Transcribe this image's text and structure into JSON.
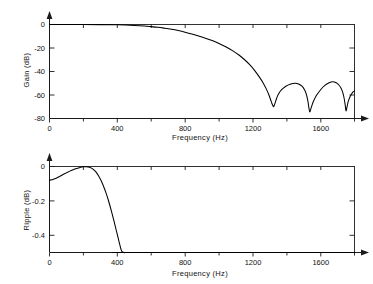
{
  "figure": {
    "background": "#ffffff",
    "line_color": "#000000",
    "axis_color": "#1a1a1a"
  },
  "chart_data": [
    {
      "type": "line",
      "id": "gain-response",
      "title": "",
      "xlabel": "Frequency (Hz)",
      "ylabel": "Gain (dB)",
      "xlim": [
        0,
        1800
      ],
      "ylim": [
        -80,
        0
      ],
      "xticks": [
        0,
        400,
        800,
        1200,
        1600
      ],
      "xticklabels": [
        "0",
        "400",
        "800",
        "1200",
        "1600"
      ],
      "xminorticks": [
        200,
        600,
        1000,
        1400,
        1800
      ],
      "yticks": [
        0,
        -20,
        -40,
        -60,
        -80
      ],
      "yticklabels": [
        "0",
        "-20",
        "-40",
        "-60",
        "-80"
      ],
      "grid": false,
      "legend": "none",
      "series": [
        {
          "name": "gain",
          "x": [
            0,
            100,
            200,
            300,
            400,
            500,
            560,
            600,
            640,
            680,
            720,
            760,
            800,
            840,
            880,
            920,
            960,
            1000,
            1040,
            1080,
            1120,
            1150,
            1180,
            1210,
            1240,
            1260,
            1280,
            1295,
            1305,
            1312,
            1318,
            1322,
            1326,
            1332,
            1340,
            1352,
            1370,
            1395,
            1420,
            1450,
            1470,
            1490,
            1505,
            1515,
            1522,
            1527,
            1531,
            1536,
            1544,
            1556,
            1575,
            1600,
            1625,
            1650,
            1672,
            1692,
            1708,
            1720,
            1730,
            1737,
            1742,
            1746,
            1750,
            1756,
            1764,
            1775,
            1788,
            1800
          ],
          "y": [
            -0.05,
            -0.06,
            -0.05,
            -0.1,
            -0.3,
            -0.8,
            -1.3,
            -1.8,
            -2.4,
            -3.2,
            -4.1,
            -5.2,
            -6.5,
            -8.0,
            -9.7,
            -11.6,
            -13.7,
            -16.1,
            -18.9,
            -22.2,
            -26.2,
            -29.8,
            -34.0,
            -39.0,
            -45.0,
            -49.5,
            -55.0,
            -60.0,
            -64.0,
            -67.0,
            -69.0,
            -70.0,
            -69.0,
            -66.5,
            -63.0,
            -59.0,
            -55.5,
            -52.5,
            -50.8,
            -50.0,
            -50.6,
            -52.5,
            -55.5,
            -59.0,
            -63.0,
            -67.0,
            -71.0,
            -74.5,
            -71.0,
            -66.0,
            -60.5,
            -55.5,
            -51.8,
            -49.6,
            -48.8,
            -49.6,
            -51.5,
            -54.0,
            -57.5,
            -61.5,
            -65.5,
            -69.5,
            -73.5,
            -70.0,
            -65.0,
            -61.0,
            -58.0,
            -56.5
          ]
        }
      ]
    },
    {
      "type": "line",
      "id": "passband-ripple",
      "title": "",
      "xlabel": "Frequency (Hz)",
      "ylabel": "Ripple (dB)",
      "xlim": [
        0,
        1800
      ],
      "ylim": [
        -0.5,
        0
      ],
      "xticks": [
        0,
        400,
        800,
        1200,
        1600
      ],
      "xticklabels": [
        "0",
        "400",
        "800",
        "1200",
        "1600"
      ],
      "xminorticks": [
        200,
        600,
        1000,
        1400,
        1800
      ],
      "yticks": [
        0,
        -0.2,
        -0.4
      ],
      "yticklabels": [
        "0",
        "-0.2",
        "-0.4"
      ],
      "grid": false,
      "legend": "none",
      "series": [
        {
          "name": "ripple",
          "x": [
            0,
            20,
            40,
            60,
            80,
            100,
            120,
            140,
            160,
            180,
            200,
            215,
            230,
            245,
            260,
            275,
            290,
            305,
            320,
            335,
            350,
            365,
            380,
            395,
            410,
            425,
            440,
            450,
            460,
            470,
            1800
          ],
          "y": [
            -0.08,
            -0.075,
            -0.068,
            -0.058,
            -0.047,
            -0.037,
            -0.027,
            -0.019,
            -0.012,
            -0.006,
            -0.002,
            -0.001,
            -0.003,
            -0.008,
            -0.018,
            -0.033,
            -0.055,
            -0.083,
            -0.118,
            -0.158,
            -0.205,
            -0.258,
            -0.315,
            -0.375,
            -0.435,
            -0.49,
            -0.5,
            -0.5,
            -0.5,
            -0.5,
            -0.5
          ]
        }
      ]
    }
  ]
}
